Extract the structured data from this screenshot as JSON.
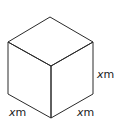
{
  "diagram": {
    "type": "cube",
    "edge_color": "#2a2a2a",
    "labels": {
      "right_edge": {
        "var": "x",
        "unit": "m"
      },
      "bottom_left_edge": {
        "var": "x",
        "unit": "m"
      },
      "bottom_right_edge": {
        "var": "x",
        "unit": "m"
      }
    }
  }
}
